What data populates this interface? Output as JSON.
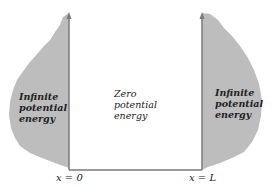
{
  "diagram": {
    "regions": {
      "left": {
        "label_lines": [
          "Infinite",
          "potential",
          "energy"
        ]
      },
      "middle": {
        "label_lines": [
          "Zero",
          "potential",
          "energy"
        ]
      },
      "right": {
        "label_lines": [
          "Infinite",
          "potential",
          "energy"
        ]
      }
    },
    "axis_labels": {
      "left_wall": "x = 0",
      "right_wall": "x = L"
    },
    "colors": {
      "wall_fill": "#bdbdbd",
      "wall_line": "#7a7a7a"
    }
  }
}
